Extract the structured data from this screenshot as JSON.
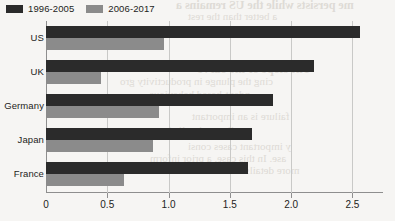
{
  "chart_data": {
    "type": "bar",
    "orientation": "horizontal",
    "title": "",
    "subtitle": "",
    "xlabel": "",
    "ylabel": "",
    "xlim": [
      0,
      2.75
    ],
    "xticks": [
      "0",
      "0.5",
      "1.0",
      "1.5",
      "2.0",
      "2.5"
    ],
    "xtick_values": [
      0,
      0.5,
      1.0,
      1.5,
      2.0,
      2.5
    ],
    "grid": "vertical",
    "legend_position": "top-left",
    "categories": [
      "US",
      "UK",
      "Germany",
      "Japan",
      "France"
    ],
    "series": [
      {
        "name": "1996-2005",
        "color": "#2b2b2b",
        "values": [
          2.56,
          2.19,
          1.85,
          1.68,
          1.65
        ]
      },
      {
        "name": "2006-2017",
        "color": "#8b8b8b",
        "values": [
          0.96,
          0.45,
          0.92,
          0.87,
          0.64
        ]
      }
    ]
  },
  "legend": {
    "items": [
      {
        "label": "1996-2005",
        "color": "#2b2b2b"
      },
      {
        "label": "2006-2017",
        "color": "#8b8b8b"
      }
    ]
  },
  "bleed_text": {
    "a": "me persists while the US remains a",
    "b": "a better than the rest",
    "c": "The slope of the curve",
    "d": "cing the plunge in productivity gro",
    "e": "ndent-based behaviour",
    "f": "failure is an important",
    "g": "elies on implied consu",
    "h": "y important cases consi",
    "i": "ase. In this case, a prior inform",
    "j": "more details. In this"
  }
}
